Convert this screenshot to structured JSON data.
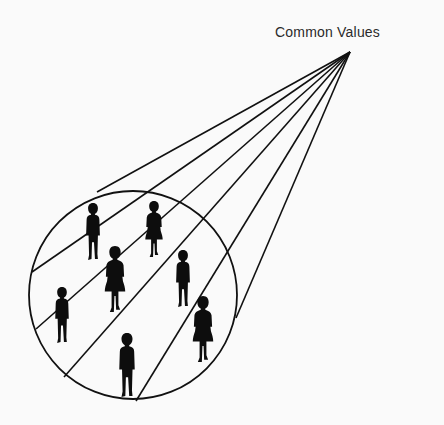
{
  "diagram": {
    "label": "Common Values",
    "apex": {
      "x": 350,
      "y": 52
    },
    "circle": {
      "cx": 133,
      "cy": 295,
      "r": 104
    },
    "lines": [
      {
        "x": 97,
        "y": 192
      },
      {
        "x": 32,
        "y": 272
      },
      {
        "x": 36,
        "y": 329
      },
      {
        "x": 64,
        "y": 377
      },
      {
        "x": 136,
        "y": 401
      },
      {
        "x": 236,
        "y": 318
      }
    ],
    "figures": [
      {
        "type": "boy",
        "x": 93,
        "y": 203,
        "h": 57
      },
      {
        "type": "girl",
        "x": 154,
        "y": 201,
        "h": 56
      },
      {
        "type": "girl",
        "x": 115,
        "y": 246,
        "h": 66
      },
      {
        "type": "boy",
        "x": 183,
        "y": 250,
        "h": 57
      },
      {
        "type": "boy",
        "x": 62,
        "y": 287,
        "h": 56
      },
      {
        "type": "girl",
        "x": 203,
        "y": 296,
        "h": 66
      },
      {
        "type": "boy",
        "x": 127,
        "y": 333,
        "h": 64
      }
    ],
    "colors": {
      "ink": "#111111",
      "background": "#fafafa"
    }
  }
}
